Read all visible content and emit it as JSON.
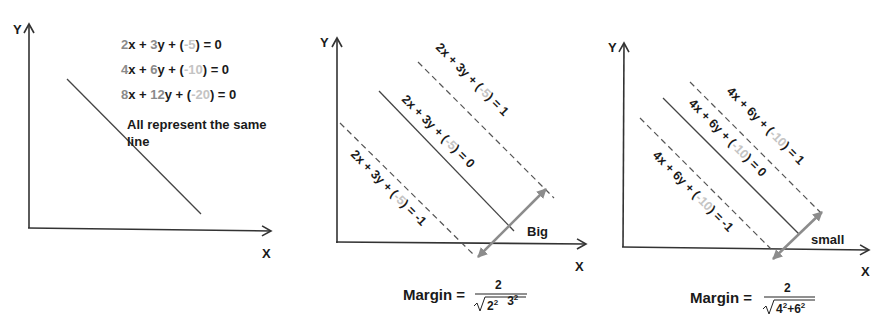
{
  "panels": [
    {
      "id": "left",
      "axes": {
        "x_label": "X",
        "y_label": "Y"
      },
      "equations": [
        {
          "a": "2",
          "xvar": "x + ",
          "b": "3",
          "yvar": "y + (",
          "c": "-5",
          "rhs": ") = 0"
        },
        {
          "a": "4",
          "xvar": "x + ",
          "b": "6",
          "yvar": "y + (",
          "c": "-10",
          "rhs": ") = 0"
        },
        {
          "a": "8",
          "xvar": "x + ",
          "b": "12",
          "yvar": "y + (",
          "c": "-20",
          "rhs": ") = 0"
        }
      ],
      "note_line1": "All represent the same",
      "note_line2": "line"
    },
    {
      "id": "middle",
      "axes": {
        "x_label": "X",
        "y_label": "Y"
      },
      "lines": [
        {
          "style": "dashed",
          "pre": "2x + 3y + (",
          "c": "-5",
          "post": ") = 1"
        },
        {
          "style": "solid",
          "pre": "2x + 3y + (",
          "c": "-5",
          "post": ") = 0"
        },
        {
          "style": "dashed",
          "pre": "2x + 3y + (",
          "c": "-5",
          "post": ") = -1"
        }
      ],
      "margin_size_label": "Big",
      "margin_formula": {
        "label": "Margin =",
        "numerator": "2",
        "radicand_a": "2",
        "radicand_b": "3",
        "exp": "2",
        "op": ""
      }
    },
    {
      "id": "right",
      "axes": {
        "x_label": "X",
        "y_label": "Y"
      },
      "lines": [
        {
          "style": "dashed",
          "pre": "4x + 6y + (",
          "c": "-10",
          "post": ") = 1"
        },
        {
          "style": "solid",
          "pre": "4x + 6y + (",
          "c": "-10",
          "post": ") = 0"
        },
        {
          "style": "dashed",
          "pre": "4x + 6y + (",
          "c": "-10",
          "post": ") = -1"
        }
      ],
      "margin_size_label": "small",
      "margin_formula": {
        "label": "Margin =",
        "numerator": "2",
        "radicand_a": "4",
        "radicand_b": "6",
        "exp": "2",
        "op": "+"
      }
    }
  ],
  "colors": {
    "axis": "#333333",
    "line": "#444444",
    "arrow": "#8c8c8c",
    "coef_gray": "#8a8a8a",
    "const_gray": "#c4c4c4",
    "text": "#1a1a1a"
  }
}
